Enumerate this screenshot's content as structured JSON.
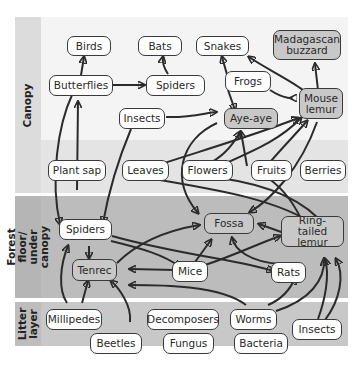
{
  "layers": [
    {
      "id": "canopy",
      "label": "Canopy"
    },
    {
      "id": "forest_floor",
      "label": "Forest floor/\nunder canopy"
    },
    {
      "id": "litter",
      "label": "Litter\nlayer"
    }
  ],
  "nodes": {
    "birds": "Birds",
    "bats": "Bats",
    "snakes": "Snakes",
    "madagascan_buzzard": "Madagascan\nbuzzard",
    "butterflies": "Butterflies",
    "spiders_canopy": "Spiders",
    "frogs": "Frogs",
    "insects_canopy": "Insects",
    "aye_aye": "Aye-aye",
    "mouse_lemur": "Mouse\nlemur",
    "plant_sap": "Plant sap",
    "leaves": "Leaves",
    "flowers": "Flowers",
    "fruits": "Fruits",
    "berries": "Berries",
    "spiders_floor": "Spiders",
    "fossa": "Fossa",
    "ring_tailed_lemur": "Ring-tailed\nlemur",
    "tenrec": "Tenrec",
    "mice": "Mice",
    "rats": "Rats",
    "millipedes": "Millipedes",
    "decomposers": "Decomposers",
    "worms": "Worms",
    "insects_litter": "Insects",
    "beetles": "Beetles",
    "fungus": "Fungus",
    "bacteria": "Bacteria"
  },
  "colors": {
    "canopy_band": "#f3f3f3",
    "canopy_lower_band": "#e6e6e6",
    "forest_band": "#bdbdbd",
    "litter_band": "#c9c9c9",
    "label_column": "#dcdcdc",
    "predator_fill": "#c8c8c8",
    "node_fill": "#ffffff",
    "arrow": "#2b2b2b"
  },
  "edges": [
    [
      "butterflies",
      "birds"
    ],
    [
      "spiders_canopy",
      "bats"
    ],
    [
      "butterflies",
      "spiders_canopy"
    ],
    [
      "frogs",
      "snakes"
    ],
    [
      "frogs",
      "aye_aye"
    ],
    [
      "frogs",
      "mouse_lemur"
    ],
    [
      "mouse_lemur",
      "snakes"
    ],
    [
      "mouse_lemur",
      "madagascan_buzzard"
    ],
    [
      "insects_canopy",
      "aye_aye"
    ],
    [
      "insects_canopy",
      "spiders_floor"
    ],
    [
      "plant_sap",
      "butterflies"
    ],
    [
      "butterflies",
      "spiders_floor"
    ],
    [
      "leaves",
      "mouse_lemur"
    ],
    [
      "leaves",
      "ring_tailed_lemur"
    ],
    [
      "flowers",
      "aye_aye"
    ],
    [
      "flowers",
      "mouse_lemur"
    ],
    [
      "flowers",
      "ring_tailed_lemur"
    ],
    [
      "fruits",
      "aye_aye"
    ],
    [
      "fruits",
      "mouse_lemur"
    ],
    [
      "fruits",
      "ring_tailed_lemur"
    ],
    [
      "aye_aye",
      "fossa"
    ],
    [
      "mouse_lemur",
      "fossa"
    ],
    [
      "spiders_floor",
      "tenrec"
    ],
    [
      "spiders_floor",
      "mice"
    ],
    [
      "spiders_floor",
      "rats"
    ],
    [
      "tenrec",
      "fossa"
    ],
    [
      "mice",
      "tenrec"
    ],
    [
      "mice",
      "fossa"
    ],
    [
      "mice",
      "ring_tailed_lemur"
    ],
    [
      "rats",
      "fossa"
    ],
    [
      "ring_tailed_lemur",
      "fossa"
    ],
    [
      "millipedes",
      "tenrec"
    ],
    [
      "millipedes",
      "spiders_floor"
    ],
    [
      "beetles",
      "tenrec"
    ],
    [
      "worms",
      "tenrec"
    ],
    [
      "worms",
      "rats"
    ],
    [
      "worms",
      "ring_tailed_lemur"
    ],
    [
      "insects_litter",
      "rats"
    ],
    [
      "insects_litter",
      "ring_tailed_lemur"
    ]
  ]
}
